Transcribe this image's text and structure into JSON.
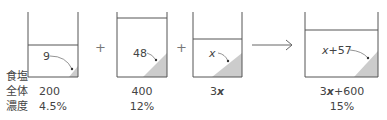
{
  "row_labels": {
    "salt": "食塩",
    "total": "全体",
    "concentration": "濃度"
  },
  "operators": {
    "plus1": "+",
    "plus2": "+"
  },
  "beakers": [
    {
      "salt": "9",
      "total": "200",
      "concentration": "4.5%"
    },
    {
      "salt": "48",
      "total": "400",
      "concentration": "12%"
    },
    {
      "salt_var": "x",
      "total_coef": "3",
      "total_var": "x",
      "concentration": ""
    },
    {
      "salt_var": "x",
      "salt_rest": "+57",
      "total_coef": "3",
      "total_var": "x",
      "total_rest": "+600",
      "concentration": "15%"
    }
  ],
  "colors": {
    "line": "#555555",
    "fill": "#cccccc",
    "arrow": "#666666"
  }
}
